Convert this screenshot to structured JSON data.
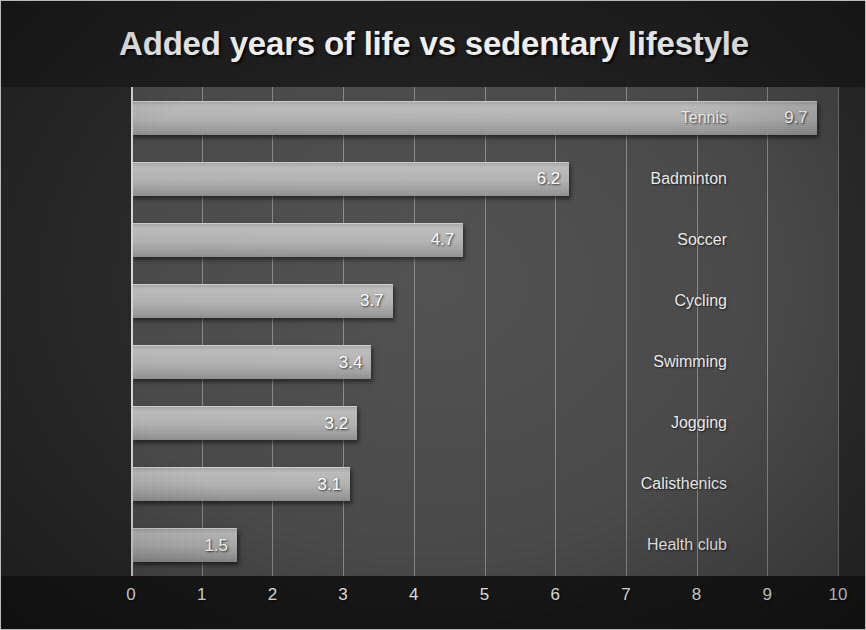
{
  "chart_data": {
    "type": "bar",
    "orientation": "horizontal",
    "title": "Added years of life vs sedentary lifestyle",
    "xlabel": "",
    "ylabel": "",
    "categories": [
      "Tennis",
      "Badminton",
      "Soccer",
      "Cycling",
      "Swimming",
      "Jogging",
      "Calisthenics",
      "Health club"
    ],
    "values": [
      9.7,
      6.2,
      4.7,
      3.7,
      3.4,
      3.2,
      3.1,
      1.5
    ],
    "value_labels": [
      "9.7",
      "6.2",
      "4.7",
      "3.7",
      "3.4",
      "3.2",
      "3.1",
      "1.5"
    ],
    "xlim": [
      0,
      10
    ],
    "xticks": [
      0,
      1,
      2,
      3,
      4,
      5,
      6,
      7,
      8,
      9,
      10
    ],
    "xtick_labels": [
      "0",
      "1",
      "2",
      "3",
      "4",
      "5",
      "6",
      "7",
      "8",
      "9",
      "10"
    ],
    "grid": "vertical",
    "legend": "none",
    "data_labels_position": "inside-end",
    "colors": {
      "bar_light": "#bdbdbd",
      "bar_dark": "#8e8e8e",
      "plot_background": "#494949",
      "figure_background": "#1b1b1b",
      "text": "#f2f2f2",
      "gridline": "#e1e1e1"
    }
  }
}
